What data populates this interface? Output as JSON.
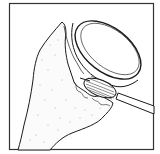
{
  "illustration": {
    "subject": "glass-with-cloth-and-brush",
    "description": "Line drawing of an upturned glass rim wrapped in a textured cloth, with a brush applied near the rim",
    "colors": {
      "background": "#ffffff",
      "line": "#1a1a1a",
      "frame": "#333333",
      "texture": "#9a9a9a"
    }
  }
}
